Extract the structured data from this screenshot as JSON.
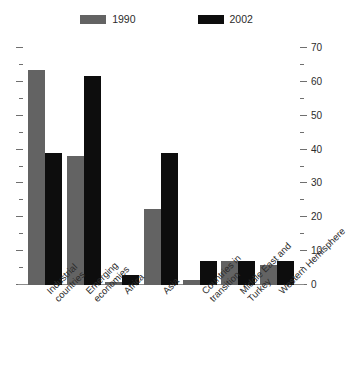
{
  "chart_data": {
    "type": "bar",
    "title": "",
    "subtitle": "",
    "xlabel": "",
    "ylabel": "",
    "ylim": [
      0,
      70
    ],
    "y_major_step": 10,
    "y_minor_step": 5,
    "grid": false,
    "legend_position": "top-center",
    "dual_axis": true,
    "axis_labels_side": "right",
    "categories": [
      "Industrial\ncountries",
      "Emerging\neconomies",
      "Africa",
      "Asia",
      "Countries in\ntransition",
      "Middle East and\nTurkey",
      "Western Hemisphere"
    ],
    "tick_labels": [
      "0",
      "10",
      "20",
      "30",
      "40",
      "50",
      "60",
      "70"
    ],
    "tick_values": [
      0,
      10,
      20,
      30,
      40,
      50,
      60,
      70
    ],
    "series": [
      {
        "name": "1990",
        "color": "#636363",
        "values": [
          63.5,
          38.0,
          1.0,
          22.5,
          1.5,
          7.0,
          6.0
        ]
      },
      {
        "name": "2002",
        "color": "#0d0d0d",
        "values": [
          39.0,
          61.7,
          3.0,
          39.0,
          7.0,
          7.0,
          7.0
        ]
      }
    ]
  },
  "legend": {
    "items": [
      {
        "label": "1990",
        "color": "#636363"
      },
      {
        "label": "2002",
        "color": "#0d0d0d"
      }
    ]
  },
  "colors": {
    "series_1990": "#636363",
    "series_2002": "#0d0d0d",
    "axis": "#8c8c8c",
    "text": "#2b2b2b",
    "background": "#ffffff"
  }
}
